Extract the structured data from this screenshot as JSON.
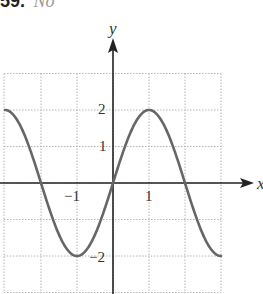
{
  "header": {
    "number": "59.",
    "answer": "No"
  },
  "colors": {
    "curve": "#666666",
    "axis": "#222222",
    "grid": "#b5b5b5"
  },
  "chart_data": {
    "type": "line",
    "title": "",
    "xlabel": "x",
    "ylabel": "y",
    "function": "y = 2 sin(pi x / 2)",
    "xlim": [
      -3,
      3
    ],
    "ylim": [
      -3,
      3
    ],
    "grid": true,
    "x_tick_labels": [
      {
        "value": -1,
        "label": "−1"
      },
      {
        "value": 1,
        "label": "1"
      }
    ],
    "y_tick_labels": [
      {
        "value": 2,
        "label": "2"
      },
      {
        "value": 1,
        "label": "1"
      },
      {
        "value": -2,
        "label": "−2"
      }
    ],
    "series": [
      {
        "name": "curve",
        "x": [
          -3,
          -2.5,
          -2,
          -1.5,
          -1,
          -0.5,
          0,
          0.5,
          1,
          1.5,
          2,
          2.5,
          3
        ],
        "y": [
          2,
          1.41,
          0,
          -1.41,
          -2,
          -1.41,
          0,
          1.41,
          2,
          1.41,
          0,
          -1.41,
          -2
        ]
      }
    ]
  }
}
